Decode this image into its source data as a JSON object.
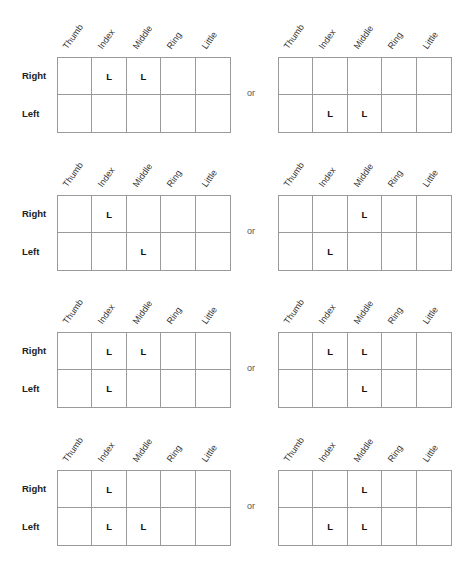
{
  "columns": [
    "Thumb",
    "Index",
    "Middle",
    "Ring",
    "Little"
  ],
  "rows": [
    "Right",
    "Left"
  ],
  "separator": "or",
  "mark": "L",
  "blocks": [
    {
      "left": {
        "Right": [
          "",
          "L",
          "L",
          "",
          ""
        ],
        "Left": [
          "",
          "",
          "",
          "",
          ""
        ]
      },
      "right": {
        "Right": [
          "",
          "",
          "",
          "",
          ""
        ],
        "Left": [
          "",
          "L",
          "L",
          "",
          ""
        ]
      }
    },
    {
      "left": {
        "Right": [
          "",
          "L",
          "",
          "",
          ""
        ],
        "Left": [
          "",
          "",
          "L",
          "",
          ""
        ]
      },
      "right": {
        "Right": [
          "",
          "",
          "L",
          "",
          ""
        ],
        "Left": [
          "",
          "L",
          "",
          "",
          ""
        ]
      }
    },
    {
      "left": {
        "Right": [
          "",
          "L",
          "L",
          "",
          ""
        ],
        "Left": [
          "",
          "L",
          "",
          "",
          ""
        ]
      },
      "right": {
        "Right": [
          "",
          "L",
          "L",
          "",
          ""
        ],
        "Left": [
          "",
          "",
          "L",
          "",
          ""
        ]
      }
    },
    {
      "left": {
        "Right": [
          "",
          "L",
          "",
          "",
          ""
        ],
        "Left": [
          "",
          "L",
          "L",
          "",
          ""
        ]
      },
      "right": {
        "Right": [
          "",
          "",
          "L",
          "",
          ""
        ],
        "Left": [
          "",
          "L",
          "L",
          "",
          ""
        ]
      }
    }
  ]
}
